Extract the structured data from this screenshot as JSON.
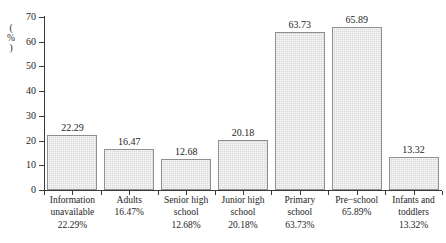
{
  "chart_data": {
    "type": "bar",
    "title": "",
    "subtitle": "",
    "xlabel": "",
    "ylabel": "(%)",
    "ylim": [
      0,
      70
    ],
    "ytick_values": [
      0,
      10,
      20,
      30,
      40,
      50,
      60,
      70
    ],
    "ytick_labels": [
      "0",
      "10",
      "20",
      "30",
      "40",
      "50",
      "60",
      "70"
    ],
    "grid": false,
    "legend": false,
    "legend_position": "none",
    "categories": [
      "Information unavailable",
      "Adults",
      "Senior high school",
      "Junior high school",
      "Primary school",
      "Pre−school",
      "Infants and toddlers"
    ],
    "category_label_lines": [
      [
        "Information",
        "unavailable"
      ],
      [
        "Adults"
      ],
      [
        "Senior high",
        "school"
      ],
      [
        "Junior high",
        "school"
      ],
      [
        "Primary",
        "school"
      ],
      [
        "Pre−school"
      ],
      [
        "Infants and",
        "toddlers"
      ]
    ],
    "category_percent_labels": [
      "22.29%",
      "16.47%",
      "12.68%",
      "20.18%",
      "63.73%",
      "65.89%",
      "13.32%"
    ],
    "values": [
      22.29,
      16.47,
      12.68,
      20.18,
      63.73,
      65.89,
      13.32
    ],
    "value_labels": [
      "22.29",
      "16.47",
      "12.68",
      "20.18",
      "63.73",
      "65.89",
      "13.32"
    ],
    "bar_fill_color": "#d9d9d9",
    "bar_edge_color": "#8f8f8f",
    "axis_color": "#3a3a3a",
    "text_color": "#1e1e1e",
    "background_color": "#ffffff"
  }
}
